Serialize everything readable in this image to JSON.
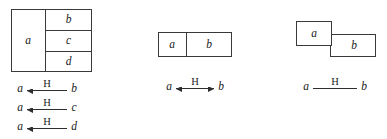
{
  "figure": {
    "line_color": "#3a3a3a",
    "text_color": "#1a1a1a",
    "background": "#ffffff"
  },
  "groups": [
    {
      "id": "group-1",
      "name": "one-to-many-partition",
      "diagram": {
        "type": "partitioned-rectangle",
        "cells": [
          {
            "label": "a",
            "position": "left-full-height"
          },
          {
            "label": "b",
            "position": "right-top"
          },
          {
            "label": "c",
            "position": "right-middle"
          },
          {
            "label": "d",
            "position": "right-bottom"
          }
        ]
      },
      "relations": [
        {
          "source": "a",
          "label": "H",
          "target": "b",
          "arrow": "left"
        },
        {
          "source": "a",
          "label": "H",
          "target": "c",
          "arrow": "left"
        },
        {
          "source": "a",
          "label": "H",
          "target": "d",
          "arrow": "left"
        }
      ]
    },
    {
      "id": "group-2",
      "name": "adjacent-pair",
      "diagram": {
        "type": "partitioned-rectangle",
        "cells": [
          {
            "label": "a",
            "position": "left"
          },
          {
            "label": "b",
            "position": "right"
          }
        ]
      },
      "relations": [
        {
          "source": "a",
          "label": "H",
          "target": "b",
          "arrow": "both"
        }
      ]
    },
    {
      "id": "group-3",
      "name": "overlapping-pair",
      "diagram": {
        "type": "overlapping-rectangles",
        "cells": [
          {
            "label": "a",
            "position": "upper-left"
          },
          {
            "label": "b",
            "position": "lower-right"
          }
        ]
      },
      "relations": [
        {
          "source": "a",
          "label": "H",
          "target": "b",
          "arrow": "none"
        }
      ]
    }
  ]
}
